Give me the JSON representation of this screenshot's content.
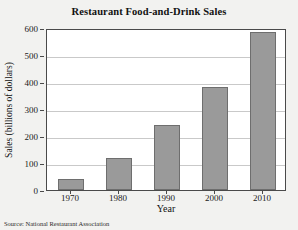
{
  "chart_data": {
    "type": "bar",
    "title": "Restaurant Food-and-Drink Sales",
    "xlabel": "Year",
    "ylabel": "Sales (billions of dollars)",
    "categories": [
      "1970",
      "1980",
      "1990",
      "2000",
      "2010"
    ],
    "values": [
      42,
      120,
      240,
      380,
      585
    ],
    "ylim": [
      0,
      600
    ],
    "yticks": [
      0,
      100,
      200,
      300,
      400,
      500,
      600
    ],
    "ytick_labels": [
      "0",
      "100",
      "200",
      "300",
      "400",
      "500",
      "600"
    ],
    "grid": "horizontal",
    "legend": "none",
    "bar_color": "#9a9a9a",
    "bar_border_color": "#6e6e6e",
    "plot_background": "#ffffff",
    "figure_background": "#f2f2f0",
    "axis_color": "#4a4a4a",
    "gridline_color": "#c9c9c9"
  },
  "source": {
    "note": "Source: National Restaurant Association"
  }
}
